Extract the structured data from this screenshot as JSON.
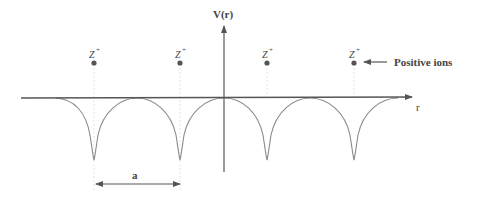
{
  "diagram": {
    "y_axis_label": "V(r)",
    "x_axis_label": "r",
    "ion_label": "Z",
    "ion_charge": "+",
    "annotation": "Positive ions",
    "spacing_label": "a",
    "ions": [
      {
        "x": 94
      },
      {
        "x": 180
      },
      {
        "x": 267
      },
      {
        "x": 354
      }
    ],
    "colors": {
      "axis": "#555555",
      "curve": "#8a8a8a",
      "ion_dot": "#555555",
      "text": "#444444",
      "guide": "#e2e2e2"
    }
  }
}
